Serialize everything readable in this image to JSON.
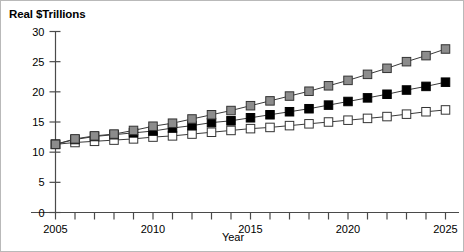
{
  "chart_data": {
    "type": "line",
    "title": "",
    "ylabel": "Real $Trillions",
    "xlabel": "Year",
    "x": [
      2005,
      2006,
      2007,
      2008,
      2009,
      2010,
      2011,
      2012,
      2013,
      2014,
      2015,
      2016,
      2017,
      2018,
      2019,
      2020,
      2021,
      2022,
      2023,
      2024,
      2025
    ],
    "xlim": [
      2005,
      2025
    ],
    "ylim": [
      0,
      30
    ],
    "xticks": [
      2005,
      2006,
      2007,
      2008,
      2009,
      2010,
      2011,
      2012,
      2013,
      2014,
      2015,
      2016,
      2017,
      2018,
      2019,
      2020,
      2021,
      2022,
      2023,
      2024,
      2025
    ],
    "xtick_labels": [
      "2005",
      "",
      "",
      "",
      "",
      "2010",
      "",
      "",
      "",
      "",
      "2015",
      "",
      "",
      "",
      "",
      "2020",
      "",
      "",
      "",
      "",
      "2025"
    ],
    "yticks": [
      0,
      5,
      10,
      15,
      20,
      25,
      30
    ],
    "ytick_labels": [
      "0",
      "5",
      "10",
      "15",
      "20",
      "25",
      "30"
    ],
    "grid": false,
    "legend": "none",
    "series": [
      {
        "name": "high",
        "marker": "filled-square-gray",
        "color": "#8c8c8c",
        "edge_color": "#333333",
        "values": [
          11.3,
          12.2,
          12.7,
          13.0,
          13.6,
          14.3,
          14.8,
          15.5,
          16.2,
          16.9,
          17.7,
          18.5,
          19.3,
          20.1,
          21.0,
          21.9,
          22.9,
          23.9,
          25.0,
          26.0,
          27.1
        ]
      },
      {
        "name": "middle",
        "marker": "filled-square-black",
        "color": "#000000",
        "edge_color": "#000000",
        "values": [
          11.3,
          12.1,
          12.6,
          12.9,
          13.2,
          13.5,
          14.0,
          14.4,
          14.9,
          15.2,
          15.7,
          16.2,
          16.7,
          17.2,
          17.8,
          18.4,
          19.0,
          19.6,
          20.3,
          20.9,
          21.6
        ]
      },
      {
        "name": "low",
        "marker": "open-square-white",
        "color": "#ffffff",
        "edge_color": "#333333",
        "values": [
          11.3,
          11.6,
          11.8,
          12.0,
          12.2,
          12.5,
          12.7,
          13.0,
          13.3,
          13.6,
          13.9,
          14.1,
          14.4,
          14.7,
          15.0,
          15.3,
          15.6,
          15.9,
          16.3,
          16.7,
          17.0
        ]
      }
    ]
  },
  "axes": {
    "y_title": "Real $Trillions",
    "x_title": "Year"
  }
}
